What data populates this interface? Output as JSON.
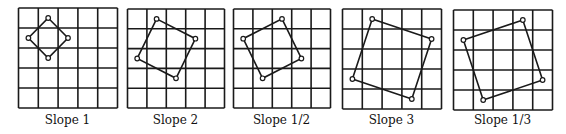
{
  "figure": {
    "grid_size": 5,
    "colors": {
      "line": "#1a1a1a",
      "background": "#ffffff",
      "vertex_fill": "#ffffff"
    },
    "panels": [
      {
        "label": "Slope 1",
        "left": 18,
        "top": 8,
        "width": 99,
        "height": 100,
        "vertices": [
          [
            1.5,
            0.5
          ],
          [
            2.5,
            1.5
          ],
          [
            1.5,
            2.5
          ],
          [
            0.5,
            1.5
          ]
        ]
      },
      {
        "label": "Slope 2",
        "left": 127,
        "top": 9,
        "width": 97,
        "height": 99,
        "vertices": [
          [
            1.5,
            0.5
          ],
          [
            3.5,
            1.5
          ],
          [
            2.5,
            3.5
          ],
          [
            0.5,
            2.5
          ]
        ]
      },
      {
        "label": "Slope 1/2",
        "left": 233,
        "top": 9,
        "width": 97,
        "height": 99,
        "vertices": [
          [
            2.5,
            0.5
          ],
          [
            3.5,
            2.5
          ],
          [
            1.5,
            3.5
          ],
          [
            0.5,
            1.5
          ]
        ]
      },
      {
        "label": "Slope 3",
        "left": 342,
        "top": 9,
        "width": 99,
        "height": 100,
        "vertices": [
          [
            1.5,
            0.5
          ],
          [
            4.5,
            1.5
          ],
          [
            3.5,
            4.5
          ],
          [
            0.5,
            3.5
          ]
        ]
      },
      {
        "label": "Slope 1/3",
        "left": 453,
        "top": 10,
        "width": 99,
        "height": 100,
        "vertices": [
          [
            3.5,
            0.5
          ],
          [
            4.5,
            3.5
          ],
          [
            1.5,
            4.5
          ],
          [
            0.5,
            1.5
          ]
        ]
      }
    ]
  }
}
